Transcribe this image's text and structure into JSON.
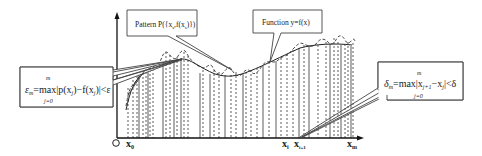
{
  "diagram": {
    "callouts": {
      "pattern": {
        "text": "Pattern P({x",
        "sub": "s",
        "text2": ",f(x",
        "sub2": "s",
        "text3": ")})",
        "full": "Pattern P({xs,f(xs)})"
      },
      "function": {
        "text": "Function y=f(x)"
      },
      "epsilon": {
        "top": "m",
        "main": "ε_m = max|p(x_j) − f(x_j)| < ε",
        "sym": "ε",
        "sym_sub": "m",
        "expr": "=max|p(x",
        "j1": "j",
        "expr2": ")−f(x",
        "j2": "j",
        "expr3": ")|<ε",
        "bottom": "j=0"
      },
      "delta": {
        "top": "m",
        "main": "δ_m = max|x_{j+1} − x_j| < δ",
        "sym": "δ",
        "sym_sub": "m",
        "expr": "=max|x",
        "j1": "j+1",
        "expr2": "−x",
        "j2": "j",
        "expr3": "|<δ",
        "bottom": "j=0"
      }
    },
    "axis_labels": {
      "origin": "O",
      "x0": "x",
      "x0_sub": "0",
      "xi": "x",
      "xi_sub": "i",
      "xi1": "x",
      "xi1_sub": "i+1",
      "xm": "x",
      "xm_sub": "m"
    },
    "legend": {
      "solid_curve": "Function y=f(x)",
      "dashed_curve": "Pattern P({xs,f(xs)})",
      "solid_verticals": "sample points",
      "dashed_verticals": "interpolation intervals"
    }
  }
}
